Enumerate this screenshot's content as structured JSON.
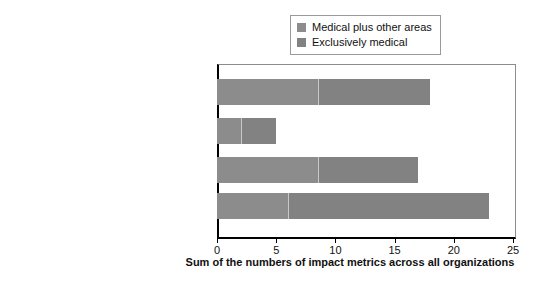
{
  "chart_data": {
    "type": "bar",
    "orientation": "horizontal",
    "stacked": true,
    "title": "",
    "xlabel": "Sum of the numbers of impact metrics across all organizations",
    "ylabel": "",
    "xlim": [
      0,
      25
    ],
    "xticks": [
      0,
      5,
      10,
      15,
      20,
      25
    ],
    "xticklabels": [
      "0",
      "5",
      "10",
      "15",
      "20",
      "25"
    ],
    "grid": false,
    "legend_position": "top-right",
    "categories": [
      "Improved health outcomes",
      "Attitudinal changes",
      "Cost-effectiveness and economic returns",
      "Impact narratives"
    ],
    "series": [
      {
        "name": "Medical plus other areas",
        "color": "#8c8c8c",
        "values": [
          8.5,
          2,
          8.5,
          6
        ]
      },
      {
        "name": "Exclusively medical",
        "color": "#828282",
        "values": [
          9.5,
          3,
          8.5,
          17
        ]
      }
    ],
    "totals": [
      18,
      5,
      17,
      23
    ]
  },
  "legend": {
    "entries": [
      {
        "label": "Medical plus other areas",
        "color": "#8c8c8c"
      },
      {
        "label": "Exclusively medical",
        "color": "#828282"
      }
    ]
  }
}
